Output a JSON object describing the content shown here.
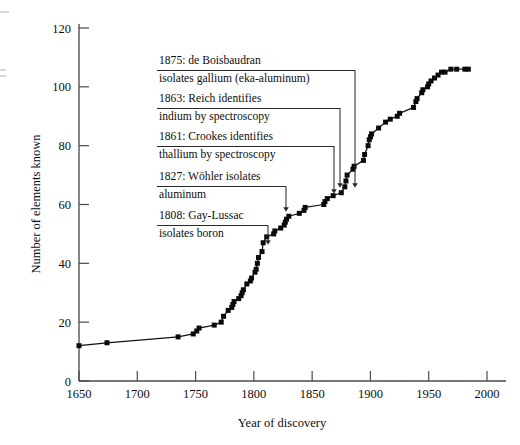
{
  "chart_data": {
    "type": "line",
    "title": "",
    "xlabel": "Year of discovery",
    "ylabel": "Number of elements known",
    "xlim": [
      1650,
      2000
    ],
    "ylim": [
      0,
      120
    ],
    "xticks": [
      1650,
      1700,
      1750,
      1800,
      1850,
      1900,
      1950,
      2000
    ],
    "xtick_labels": [
      "1650",
      "1700",
      "1750",
      "1800",
      "1850",
      "1900",
      "1950",
      "2000"
    ],
    "yticks": [
      0,
      20,
      40,
      60,
      80,
      100,
      120
    ],
    "ytick_labels": [
      "0",
      "20",
      "40",
      "60",
      "80",
      "100",
      "120"
    ],
    "grid": false,
    "legend": false,
    "marker": "filled-square",
    "series": [
      {
        "name": "Elements known",
        "x": [
          1650,
          1674,
          1735,
          1748,
          1751,
          1753,
          1766,
          1772,
          1774,
          1778,
          1781,
          1782,
          1783,
          1787,
          1789,
          1790,
          1791,
          1794,
          1797,
          1798,
          1801,
          1802,
          1803,
          1804,
          1807,
          1808,
          1811,
          1817,
          1818,
          1823,
          1826,
          1827,
          1828,
          1830,
          1839,
          1843,
          1844,
          1860,
          1861,
          1863,
          1868,
          1875,
          1878,
          1879,
          1880,
          1885,
          1886,
          1894,
          1895,
          1898,
          1899,
          1900,
          1901,
          1907,
          1913,
          1917,
          1923,
          1925,
          1937,
          1939,
          1940,
          1944,
          1945,
          1949,
          1950,
          1952,
          1955,
          1958,
          1961,
          1964,
          1969,
          1974,
          1981,
          1984
        ],
        "y": [
          12,
          13,
          15,
          16,
          17,
          18,
          19,
          20,
          22,
          24,
          25,
          26,
          27,
          28,
          29,
          30,
          31,
          33,
          34,
          35,
          37,
          38,
          40,
          42,
          44,
          47,
          49,
          50,
          51,
          52,
          53,
          54,
          55,
          56,
          57,
          58,
          59,
          60,
          61,
          62,
          63,
          64,
          66,
          68,
          70,
          72,
          73,
          75,
          77,
          80,
          82,
          83,
          84,
          86,
          88,
          89,
          90,
          91,
          93,
          95,
          96,
          98,
          99,
          100,
          101,
          102,
          103,
          104,
          105,
          105,
          106,
          106,
          106,
          106
        ]
      }
    ],
    "annotations": [
      {
        "id": "anno-1875",
        "line1": "1875: de Boisbaudran",
        "line2": "isolates gallium (eka-aluminum)",
        "target_year": 1875,
        "target_value": 64
      },
      {
        "id": "anno-1863",
        "line1": "1863: Reich identifies",
        "line2": "indium by spectroscopy",
        "target_year": 1863,
        "target_value": 62
      },
      {
        "id": "anno-1861",
        "line1": "1861: Crookes identifies",
        "line2": "thallium by spectroscopy",
        "target_year": 1861,
        "target_value": 61
      },
      {
        "id": "anno-1827",
        "line1": "1827: Wöhler isolates",
        "line2": "aluminum",
        "target_year": 1827,
        "target_value": 54
      },
      {
        "id": "anno-1808",
        "line1": "1808: Gay-Lussac",
        "line2": "isolates boron",
        "target_year": 1808,
        "target_value": 47
      }
    ]
  },
  "figure": {
    "background_color": "#ffffff",
    "line_color": "#111111",
    "marker_color": "#0a0a0a",
    "axis_color": "#4a4a4a"
  }
}
